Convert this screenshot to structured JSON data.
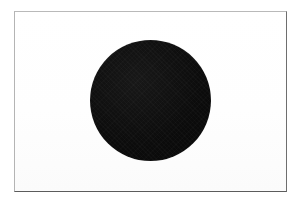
{
  "image": {
    "subject": "Flag of Japan",
    "alt_text": "Flag of Japan",
    "rendering": "black and white scanned print",
    "width": 304,
    "height": 202,
    "background_color": "#ffffff"
  },
  "flag": {
    "name": "Flag of Japan",
    "nickname": "Hinomaru",
    "field": {
      "label": "flag field",
      "color": "#ffffff",
      "x": 14,
      "y": 11,
      "width": 273,
      "height": 181
    },
    "border": {
      "label": "flag border",
      "top_color": "#b9b9b9",
      "left_color": "#b4b4b4",
      "right_color": "#6e6e6e",
      "bottom_color": "#5c5c5c",
      "thickness": 1
    },
    "disc": {
      "label": "central disc",
      "color": "#0d0d0d",
      "center_x": 150,
      "center_y": 100,
      "diameter": 121,
      "radius": 60
    }
  }
}
